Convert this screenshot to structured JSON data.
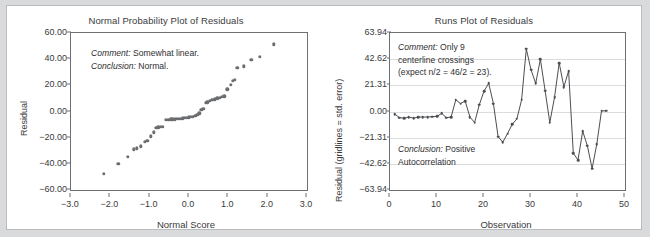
{
  "figure": {
    "background": "#d9dadb",
    "panel_background": "#ffffff",
    "border_color": "#b9bbbd",
    "marker_color": "#6b6d70",
    "line_color": "#4c4e51",
    "gridline_color": "#dadcde"
  },
  "chart_data": [
    {
      "type": "scatter",
      "title": "Normal Probability Plot of Residuals",
      "xlabel": "Normal Score",
      "ylabel": "Residual",
      "xlim": [
        -3.0,
        3.0
      ],
      "ylim": [
        -60.0,
        60.0
      ],
      "grid": false,
      "xticks": [
        -3.0,
        -2.0,
        -1.0,
        0.0,
        1.0,
        2.0,
        3.0
      ],
      "xticklabels": [
        "−3.0",
        "−2.0",
        "−1.0",
        "0.0",
        "1.0",
        "2.0",
        "3.0"
      ],
      "yticks": [
        60,
        40,
        20,
        0,
        -20,
        -40,
        -60
      ],
      "yticklabels": [
        "60.00",
        "40.00",
        "20.00",
        "0.00",
        "−20.00",
        "−40.00",
        "−60.00"
      ],
      "annotations": [
        {
          "label": "Comment:",
          "text": " Somewhat linear."
        },
        {
          "label": "Conclusion:",
          "text": " Normal."
        }
      ],
      "points": [
        {
          "x": -2.16,
          "y": -47.5
        },
        {
          "x": -1.8,
          "y": -40.0
        },
        {
          "x": -1.56,
          "y": -34.8
        },
        {
          "x": -1.4,
          "y": -28.8
        },
        {
          "x": -1.33,
          "y": -28.2
        },
        {
          "x": -1.23,
          "y": -26.6
        },
        {
          "x": -1.12,
          "y": -23.0
        },
        {
          "x": -1.06,
          "y": -22.3
        },
        {
          "x": -0.97,
          "y": -19.0
        },
        {
          "x": -0.9,
          "y": -16.0
        },
        {
          "x": -0.83,
          "y": -12.4
        },
        {
          "x": -0.78,
          "y": -12.2
        },
        {
          "x": -0.72,
          "y": -11.9
        },
        {
          "x": -0.66,
          "y": -11.6
        },
        {
          "x": -0.59,
          "y": -6.4
        },
        {
          "x": -0.53,
          "y": -6.2
        },
        {
          "x": -0.47,
          "y": -6.1
        },
        {
          "x": -0.42,
          "y": -6.0
        },
        {
          "x": -0.36,
          "y": -5.9
        },
        {
          "x": -0.31,
          "y": -5.8
        },
        {
          "x": -0.26,
          "y": -5.6
        },
        {
          "x": -0.21,
          "y": -5.4
        },
        {
          "x": -0.16,
          "y": -5.2
        },
        {
          "x": -0.1,
          "y": -5.0
        },
        {
          "x": -0.05,
          "y": -4.8
        },
        {
          "x": 0.0,
          "y": -4.5
        },
        {
          "x": 0.05,
          "y": -4.2
        },
        {
          "x": 0.1,
          "y": -3.9
        },
        {
          "x": 0.16,
          "y": -3.3
        },
        {
          "x": 0.21,
          "y": -2.3
        },
        {
          "x": 0.26,
          "y": -1.5
        },
        {
          "x": 0.31,
          "y": 1.4
        },
        {
          "x": 0.36,
          "y": 2.0
        },
        {
          "x": 0.42,
          "y": 6.6
        },
        {
          "x": 0.47,
          "y": 7.0
        },
        {
          "x": 0.53,
          "y": 8.2
        },
        {
          "x": 0.59,
          "y": 8.8
        },
        {
          "x": 0.66,
          "y": 9.4
        },
        {
          "x": 0.72,
          "y": 10.0
        },
        {
          "x": 0.78,
          "y": 10.6
        },
        {
          "x": 0.83,
          "y": 11.2
        },
        {
          "x": 0.9,
          "y": 11.5
        },
        {
          "x": 0.97,
          "y": 17.0
        },
        {
          "x": 1.06,
          "y": 20.5
        },
        {
          "x": 1.12,
          "y": 23.6
        },
        {
          "x": 1.16,
          "y": 24.0
        },
        {
          "x": 1.23,
          "y": 33.6
        },
        {
          "x": 1.4,
          "y": 34.4
        },
        {
          "x": 1.58,
          "y": 39.6
        },
        {
          "x": 1.8,
          "y": 42.0
        },
        {
          "x": 2.16,
          "y": 51.5
        }
      ]
    },
    {
      "type": "line",
      "title": "Runs Plot of Residuals",
      "xlabel": "Observation",
      "ylabel": "Residual (gridlines = std. error)",
      "xlim": [
        0,
        50
      ],
      "ylim": [
        -63.94,
        63.94
      ],
      "grid": true,
      "xticks": [
        0,
        10,
        20,
        30,
        40,
        50
      ],
      "xticklabels": [
        "0",
        "10",
        "20",
        "30",
        "40",
        "50"
      ],
      "yticks": [
        63.94,
        42.62,
        21.31,
        0.0,
        -21.31,
        -42.62,
        -63.94
      ],
      "yticklabels": [
        "63.94",
        "42.62",
        "21.31",
        "0.00",
        "−21.31",
        "−42.62",
        "−63.94"
      ],
      "annotations": [
        {
          "label": "Comment:",
          "text": " Only 9"
        },
        {
          "label": "",
          "text": "centerline crossings"
        },
        {
          "label": "",
          "text": "(expect n/2 = 46/2 = 23)."
        },
        {
          "label": "Conclusion:",
          "text": " Positive"
        },
        {
          "label": "",
          "text": "Autocorrelation"
        }
      ],
      "x": [
        1,
        2,
        3,
        4,
        5,
        6,
        7,
        8,
        9,
        10,
        11,
        12,
        13,
        14,
        15,
        16,
        17,
        18,
        19,
        20,
        21,
        22,
        23,
        24,
        25,
        26,
        27,
        28,
        29,
        30,
        31,
        32,
        33,
        34,
        35,
        36,
        37,
        38,
        39,
        40,
        41,
        42,
        43,
        44,
        45,
        46
      ],
      "values": [
        -2.0,
        -5.0,
        -5.5,
        -4.5,
        -5.5,
        -4.5,
        -4.5,
        -4.5,
        -4.2,
        -4.0,
        -1.5,
        -5.0,
        -4.5,
        9.5,
        6.5,
        8.5,
        -4.5,
        -9.0,
        5.5,
        16.5,
        23.0,
        6.5,
        -20.5,
        -25.0,
        -18.0,
        -10.5,
        -6.0,
        9.5,
        51.0,
        34.0,
        23.0,
        42.5,
        17.0,
        -9.0,
        11.5,
        39.5,
        20.0,
        33.0,
        -34.0,
        -39.5,
        -16.0,
        -28.0,
        -46.5,
        -26.5,
        0.5,
        0.5
      ]
    }
  ]
}
